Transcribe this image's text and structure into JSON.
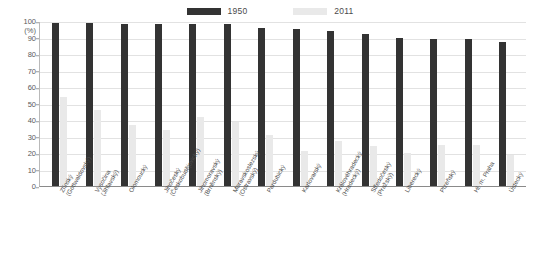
{
  "chart_data": {
    "type": "bar",
    "title": "",
    "subtitle": "",
    "xlabel": "",
    "ylabel": "(%)",
    "ylim": [
      0,
      100
    ],
    "grid": true,
    "legend_position": "top-center",
    "ytick_labels": [
      "100",
      "90",
      "80",
      "70",
      "60",
      "50",
      "40",
      "30",
      "20",
      "10",
      "0"
    ],
    "ytick_values": [
      100,
      90,
      80,
      70,
      60,
      50,
      40,
      30,
      20,
      10,
      0
    ],
    "y_unit": "(%)",
    "categories": [
      "Zlínský (Gottwaldovský)",
      "Vysočina (Jihlavský)",
      "Olomoucký",
      "Jihočeský (Českobudějovický)",
      "Jihomoravský (Brněnský)",
      "Moravskoslezský (Ostravský)",
      "Pardubický",
      "Karlovarský",
      "Královéhradecký (Hradecký)",
      "Středočeský (Pražský)",
      "Liberecký",
      "Plzeňský",
      "Hl. m. Praha",
      "Ústecký"
    ],
    "category_lines": [
      [
        "Zlínský",
        "(Gottwaldovský)"
      ],
      [
        "Vysočina",
        "(Jihlavský)"
      ],
      [
        "Olomoucký",
        ""
      ],
      [
        "Jihočeský",
        "(Českobudějovický)"
      ],
      [
        "Jihomoravský",
        "(Brněnský)"
      ],
      [
        "Moravskoslezský",
        "(Ostravský)"
      ],
      [
        "Pardubický",
        ""
      ],
      [
        "Karlovarský",
        ""
      ],
      [
        "Královéhradecký",
        "(Hradecký)"
      ],
      [
        "Středočeský",
        "(Pražský)"
      ],
      [
        "Liberecký",
        ""
      ],
      [
        "Plzeňský",
        ""
      ],
      [
        "Hl. m. Praha",
        ""
      ],
      [
        "Ústecký",
        ""
      ]
    ],
    "series": [
      {
        "name": "1950",
        "color": "#333333",
        "values": [
          99,
          99,
          98,
          98,
          98,
          98,
          96,
          95,
          94,
          92,
          90,
          89,
          89,
          87
        ]
      },
      {
        "name": "2011",
        "color": "#e9e9e9",
        "values": [
          54,
          46,
          37,
          34,
          42,
          39,
          31,
          21,
          27,
          24,
          20,
          25,
          25,
          19
        ]
      }
    ]
  },
  "legend": {
    "items": [
      {
        "label": "1950",
        "color": "#333333"
      },
      {
        "label": "2011",
        "color": "#e9e9e9"
      }
    ]
  }
}
